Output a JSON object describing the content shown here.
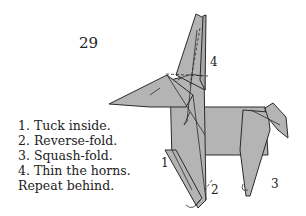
{
  "step": {
    "number": "29"
  },
  "instructions": [
    "1. Tuck inside.",
    "2. Reverse-fold.",
    "3. Squash-fold.",
    "4. Thin the horns.",
    "Repeat behind."
  ],
  "diagram": {
    "callouts": [
      "1",
      "2",
      "3",
      "4"
    ],
    "paper_color": "#b4b4b4",
    "line_color": "#2a2a2a"
  }
}
